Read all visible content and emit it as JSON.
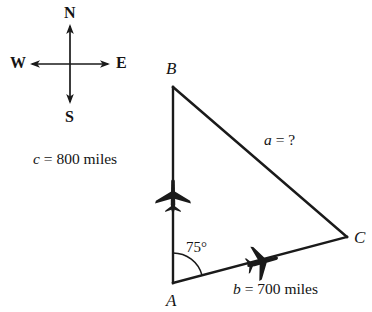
{
  "figure": {
    "background_color": "#ffffff",
    "line_color": "#1a1a1a",
    "compass": {
      "north_label": "N",
      "south_label": "S",
      "east_label": "E",
      "west_label": "W",
      "center": {
        "x": 70,
        "y": 64
      }
    },
    "triangle": {
      "vertices": [
        {
          "name": "B",
          "label": "B",
          "x": 173,
          "y": 87
        },
        {
          "name": "A",
          "label": "A",
          "x": 173,
          "y": 283
        },
        {
          "name": "C",
          "label": "C",
          "x": 347,
          "y": 237
        }
      ],
      "sides": [
        {
          "name": "a",
          "label_var": "a",
          "label_eq": "=",
          "label_val": "?",
          "label_full": "a = ?",
          "from": "B",
          "to": "C",
          "value": null,
          "unit": "miles"
        },
        {
          "name": "b",
          "label_var": "b",
          "label_eq": "=",
          "label_val": "700 miles",
          "label_full": "b = 700 miles",
          "from": "A",
          "to": "C",
          "value": 700,
          "unit": "miles"
        },
        {
          "name": "c",
          "label_var": "c",
          "label_eq": "=",
          "label_val": "800 miles",
          "label_full": "c = 800 miles",
          "from": "A",
          "to": "B",
          "value": 800,
          "unit": "miles"
        }
      ],
      "angle": {
        "at_vertex": "A",
        "label": "75°",
        "value": 75,
        "unit": "degrees"
      }
    },
    "airplane_markers": [
      {
        "on_side": "c",
        "heading_label": "north",
        "x": 173,
        "y": 196,
        "rotation_deg": 0
      },
      {
        "on_side": "b",
        "heading_label": "toward-C",
        "x": 262,
        "y": 262,
        "rotation_deg": 15
      }
    ]
  }
}
